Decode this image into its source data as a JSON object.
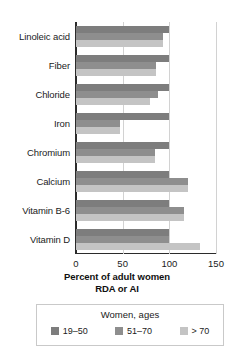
{
  "chart_data": {
    "type": "bar",
    "orientation": "horizontal",
    "title": "",
    "xlabel": "Percent of adult  women RDA or AI",
    "xlabel_line1": "Percent of adult  women",
    "xlabel_line2": "RDA or AI",
    "ylabel": "",
    "xlim": [
      0,
      150
    ],
    "xticks": [
      0,
      50,
      100,
      150
    ],
    "xtick_labels": [
      "0",
      "50",
      "100",
      "150"
    ],
    "grid": true,
    "grid_axis": "x",
    "legend_position": "bottom",
    "legend_title": "Women, ages",
    "categories": [
      "Linoleic acid",
      "Fiber",
      "Chloride",
      "Iron",
      "Chromium",
      "Calcium",
      "Vitamin B-6",
      "Vitamin D"
    ],
    "series": [
      {
        "name": "19–50",
        "color": "#7d7d7d",
        "values": [
          100,
          100,
          100,
          100,
          100,
          100,
          100,
          100
        ]
      },
      {
        "name": "51–70",
        "color": "#8e8e8e",
        "values": [
          93,
          86,
          88,
          47,
          85,
          120,
          116,
          100
        ]
      },
      {
        "name": "> 70",
        "color": "#c4c4c4",
        "values": [
          93,
          86,
          79,
          47,
          85,
          120,
          116,
          133
        ]
      }
    ]
  },
  "axis": {
    "line_color": "#2b2b2b",
    "grid_color": "#d2d2d2"
  }
}
